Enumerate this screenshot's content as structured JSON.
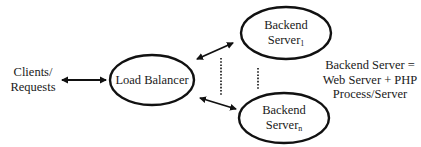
{
  "diagram": {
    "type": "load-balancing-architecture",
    "colors": {
      "stroke": "#111111",
      "text": "#1a1a1a",
      "background": "#ffffff"
    },
    "client": {
      "line1": "Clients/",
      "line2": "Requests"
    },
    "load_balancer": {
      "label": "Load Balancer"
    },
    "backend_first": {
      "line1": "Backend",
      "line2": "Server",
      "subscript": "1"
    },
    "backend_last": {
      "line1": "Backend",
      "line2": "Server",
      "subscript": "n"
    },
    "annotation": {
      "line1": "Backend Server =",
      "line2": "Web Server + PHP",
      "line3": "Process/Server"
    },
    "edges": [
      {
        "from": "client",
        "to": "load_balancer",
        "style": "bidirectional-arrow"
      },
      {
        "from": "load_balancer",
        "to": "backend_first",
        "style": "bidirectional-arrow"
      },
      {
        "from": "load_balancer",
        "to": "backend_last",
        "style": "bidirectional-arrow"
      },
      {
        "from": "backend_first",
        "to": "backend_last",
        "style": "dotted-ellipsis"
      }
    ]
  }
}
